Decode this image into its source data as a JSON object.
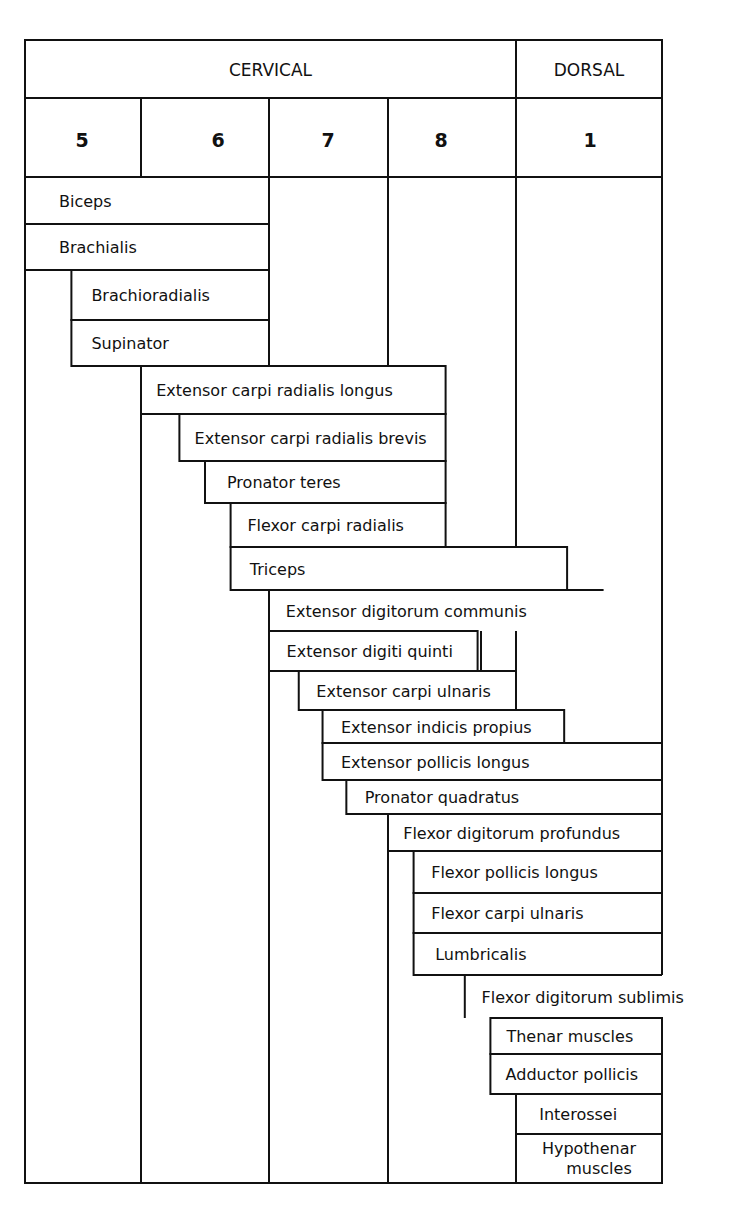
{
  "header": {
    "regions": [
      {
        "label": "CERVICAL",
        "segments": [
          "5",
          "6",
          "7",
          "8"
        ]
      },
      {
        "label": "DORSAL",
        "segments": [
          "1"
        ]
      }
    ],
    "segments": [
      "5",
      "6",
      "7",
      "8",
      "1"
    ]
  },
  "muscles": [
    {
      "name": "Biceps",
      "from": 0,
      "to": 2
    },
    {
      "name": "Brachialis",
      "from": 0,
      "to": 2
    },
    {
      "name": "Brachioradialis",
      "from": 0.4,
      "to": 2
    },
    {
      "name": "Supinator",
      "from": 0.4,
      "to": 2
    },
    {
      "name": "Extensor carpi radialis longus",
      "from": 1,
      "to": 3.45
    },
    {
      "name": "Extensor carpi radialis brevis",
      "from": 1.3,
      "to": 3.45
    },
    {
      "name": "Pronator teres",
      "from": 1.5,
      "to": 3.45
    },
    {
      "name": "Flexor carpi radialis",
      "from": 1.7,
      "to": 3.45
    },
    {
      "name": "Triceps",
      "from": 1.7,
      "to": 4.35
    },
    {
      "name": "Extensor digitorum communis",
      "from": 2,
      "to": 4.6,
      "open_right": true
    },
    {
      "name": "Extensor digiti quinti",
      "from": 2,
      "to": 3.7
    },
    {
      "name": "Extensor carpi ulnaris",
      "from": 2.25,
      "to": 4
    },
    {
      "name": "Extensor indicis propius",
      "from": 2.45,
      "to": 4.33
    },
    {
      "name": "Extensor pollicis longus",
      "from": 2.45,
      "to": 5
    },
    {
      "name": "Pronator quadratus",
      "from": 2.65,
      "to": 5
    },
    {
      "name": "Flexor digitorum profundus",
      "from": 3,
      "to": 5
    },
    {
      "name": "Flexor pollicis longus",
      "from": 3.2,
      "to": 5
    },
    {
      "name": "Flexor carpi ulnaris",
      "from": 3.2,
      "to": 5
    },
    {
      "name": "Lumbricalis",
      "from": 3.2,
      "to": 5
    },
    {
      "name": "Flexor digitorum sublimis",
      "from": 3.6,
      "to": 5.5,
      "open_right": true
    },
    {
      "name": "Thenar muscles",
      "from": 3.8,
      "to": 5
    },
    {
      "name": "Adductor pollicis",
      "from": 3.8,
      "to": 5
    },
    {
      "name": "Interossei",
      "from": 4,
      "to": 5
    },
    {
      "name": "Hypothenar muscles",
      "from": 4,
      "to": 5,
      "lines": [
        "Hypothenar",
        "muscles"
      ]
    }
  ]
}
